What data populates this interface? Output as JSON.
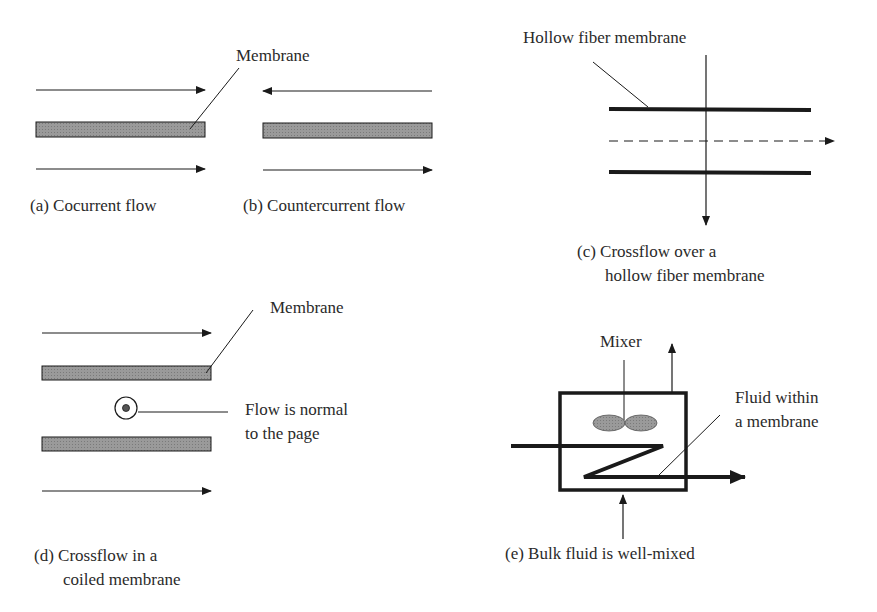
{
  "colors": {
    "line": "#1a1a1a",
    "membrane_fill": "#8c8c8c",
    "background": "#ffffff"
  },
  "panel_a": {
    "membrane_label": "Membrane",
    "caption": "(a) Cocurrent flow",
    "flow_top": "right",
    "flow_bottom": "right"
  },
  "panel_b": {
    "caption": "(b) Countercurrent flow",
    "flow_top": "left",
    "flow_bottom": "right"
  },
  "panel_c": {
    "membrane_label": "Hollow fiber membrane",
    "caption_line1": "(c) Crossflow over a",
    "caption_line2": "hollow fiber membrane"
  },
  "panel_d": {
    "membrane_label": "Membrane",
    "normal_flow_label_line1": "Flow is normal",
    "normal_flow_label_line2": "to the page",
    "caption_line1": "(d) Crossflow in a",
    "caption_line2": "coiled membrane"
  },
  "panel_e": {
    "mixer_label": "Mixer",
    "fluid_label_line1": "Fluid within",
    "fluid_label_line2": "a membrane",
    "caption": "(e) Bulk fluid is well-mixed"
  }
}
